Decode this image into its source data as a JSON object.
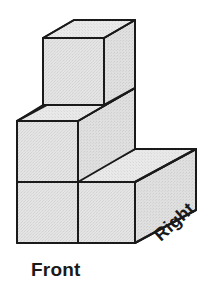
{
  "figure": {
    "orientation_labels": {
      "front": "Front",
      "right": "Right"
    },
    "colors": {
      "top_face": "#e3e3e3",
      "front_face": "#e0e0e0",
      "side_face": "#dcdcdc",
      "outline": "#1a1a1a",
      "background": "#ffffff",
      "label_text": "#1a1a1a"
    },
    "geometry": {
      "unit_front_width": 61,
      "unit_height": 61,
      "depth_dx": 61,
      "depth_dy": -33,
      "origin_x": 17,
      "origin_y": 243
    },
    "cubes": [
      {
        "name": "bottom-front-left",
        "col": 0,
        "row": 0,
        "layer": 0
      },
      {
        "name": "bottom-front-right",
        "col": 1,
        "row": 0,
        "layer": 0
      },
      {
        "name": "bottom-back-right",
        "col": 1,
        "row": 1,
        "layer": 0
      },
      {
        "name": "middle-left",
        "col": 0,
        "row": 0,
        "layer": 1
      },
      {
        "name": "top-left",
        "col": 0,
        "row": 0,
        "layer": 2
      }
    ],
    "cube_count": 5
  }
}
